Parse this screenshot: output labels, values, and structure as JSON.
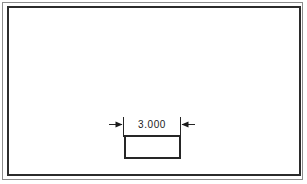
{
  "drawing": {
    "background_color": "#ffffff",
    "line_color": "#262626",
    "frame_outer_color": "#8c8c8c",
    "frame_inner_color": "#2b2b2b",
    "sheet": {
      "outer_frame_name": "sheet-outer-border",
      "inner_frame_name": "sheet-inner-border"
    },
    "part": {
      "shape": "rectangle",
      "fill": "#ffffff",
      "stroke": "#262626"
    },
    "dimension": {
      "value_label": "3.000",
      "arrow_style": "outside",
      "left_arrow_direction": "right",
      "right_arrow_direction": "left",
      "extension_line_count": 2,
      "dimension_line_count": 2
    }
  }
}
